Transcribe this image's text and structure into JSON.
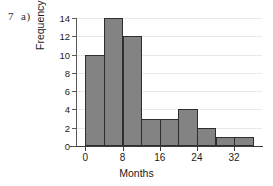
{
  "question_label": {
    "number": "7",
    "part": "a)"
  },
  "chart_data": {
    "type": "bar",
    "title": "",
    "xlabel": "Months",
    "ylabel": "Frequency",
    "categories": [
      "0-4",
      "4-8",
      "8-12",
      "12-16",
      "16-20",
      "20-24",
      "24-28",
      "28-32",
      "32-36"
    ],
    "bin_edges": [
      0,
      4,
      8,
      12,
      16,
      20,
      24,
      28,
      32,
      36
    ],
    "values": [
      10,
      14,
      12,
      3,
      3,
      4,
      2,
      1,
      1
    ],
    "xlim": [
      -2,
      38
    ],
    "ylim": [
      0,
      14
    ],
    "ytick_labels": [
      "14",
      "12",
      "10",
      "8",
      "6",
      "4",
      "2",
      "0"
    ],
    "ytick_values": [
      14,
      12,
      10,
      8,
      6,
      4,
      2,
      0
    ],
    "xtick_labels": [
      "0",
      "8",
      "16",
      "24",
      "32"
    ],
    "xtick_values": [
      0,
      8,
      16,
      24,
      32
    ],
    "grid": true,
    "legend": "none",
    "bar_color": "#838383",
    "bar_edge_color": "#2e2e2e",
    "grid_color": "#e9e9e9",
    "axis_color": "#3c3c3c"
  }
}
